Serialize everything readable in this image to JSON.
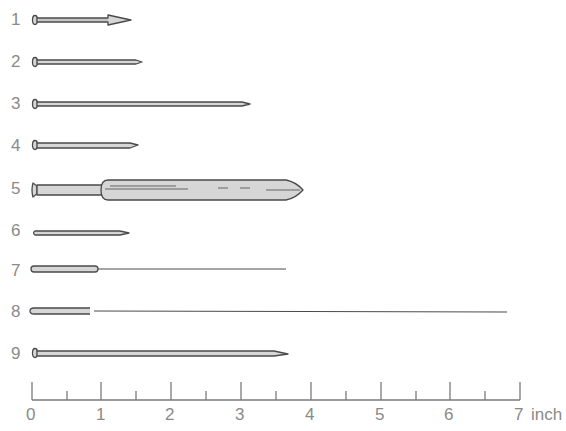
{
  "diagram": {
    "title": "",
    "colors": {
      "outline": "#4a4a4a",
      "fill": "#d6d6d6",
      "label": "#8a8a8a",
      "ruler": "#7a7a7a"
    },
    "items": [
      {
        "label": "1",
        "type": "pin-arrow-tip",
        "length_in": 1.45
      },
      {
        "label": "2",
        "type": "pin",
        "length_in": 1.6
      },
      {
        "label": "3",
        "type": "pin",
        "length_in": 3.2
      },
      {
        "label": "4",
        "type": "pin",
        "length_in": 1.55
      },
      {
        "label": "5",
        "type": "pin-wide-sheath",
        "length_in": 3.85
      },
      {
        "label": "6",
        "type": "headless-pin",
        "length_in": 1.4
      },
      {
        "label": "7",
        "type": "hub-with-fine-wire",
        "length_in": 3.7
      },
      {
        "label": "8",
        "type": "hub-with-separate-fine-wire",
        "length_in": 6.75
      },
      {
        "label": "9",
        "type": "pin",
        "length_in": 3.7
      }
    ],
    "ruler": {
      "ticks": [
        "0",
        "1",
        "2",
        "3",
        "4",
        "5",
        "6",
        "7"
      ],
      "unit": "inch",
      "half_ticks": true,
      "max_in": 7
    }
  }
}
